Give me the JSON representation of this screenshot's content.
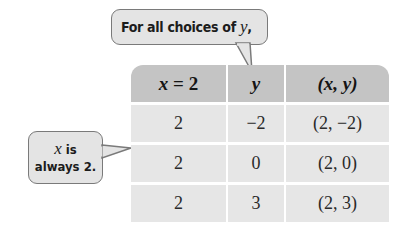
{
  "callouts": {
    "top": {
      "text_prefix": "For all choices of ",
      "var": "y",
      "suffix": ","
    },
    "left": {
      "var": "x",
      "line1_rest": " is",
      "line2": "always 2."
    }
  },
  "table": {
    "headers": [
      {
        "var": "x",
        "rest": " = 2"
      },
      {
        "var": "y",
        "rest": ""
      },
      {
        "var": "(x, y)",
        "rest": ""
      }
    ],
    "rows": [
      [
        "2",
        "−2",
        "(2, −2)"
      ],
      [
        "2",
        "0",
        "(2, 0)"
      ],
      [
        "2",
        "3",
        "(2, 3)"
      ]
    ]
  },
  "colors": {
    "header_bg": "#c4c4c4",
    "cell_bg": "#e6e6e6",
    "callout_bg": "#e4e4e4",
    "callout_border": "#7a7a7a"
  }
}
